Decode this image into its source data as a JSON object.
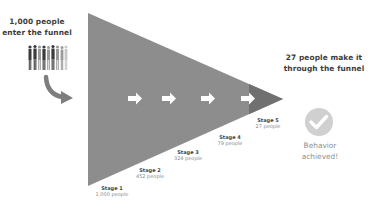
{
  "intro": {
    "line1": "1,000 people",
    "line2": "enter the funnel",
    "people_icon": "crowd-icon",
    "arrow_icon": "curved-arrow-icon"
  },
  "outro": {
    "line1": "27 people make it",
    "line2": "through the funnel",
    "check_icon": "checkmark-circle-icon",
    "result_line1": "Behavior",
    "result_line2": "achieved!"
  },
  "funnel": {
    "colors": {
      "body": "#8d8d8d",
      "tip": "#707070",
      "arrows": "#ffffff",
      "check_circle": "#d0d0d0"
    },
    "arrow_count": 4,
    "stages": [
      {
        "name": "Stage 1",
        "count": "1,000 people"
      },
      {
        "name": "Stage 2",
        "count": "452 people"
      },
      {
        "name": "Stage 3",
        "count": "324 people"
      },
      {
        "name": "Stage 4",
        "count": "79 people"
      },
      {
        "name": "Stage 5",
        "count": "27 people"
      }
    ]
  }
}
